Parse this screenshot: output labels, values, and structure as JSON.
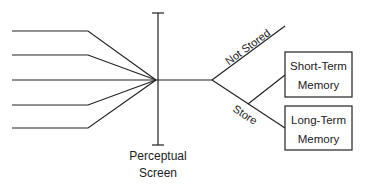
{
  "diagram": {
    "screen_label_line1": "Perceptual",
    "screen_label_line2": "Screen",
    "branch_not_stored": "Not Stored",
    "branch_store": "Store",
    "short_term_line1": "Short-Term",
    "short_term_line2": "Memory",
    "long_term_line1": "Long-Term",
    "long_term_line2": "Memory",
    "input_count": 5,
    "colors": {
      "stroke": "#222222",
      "background": "#ffffff"
    }
  }
}
